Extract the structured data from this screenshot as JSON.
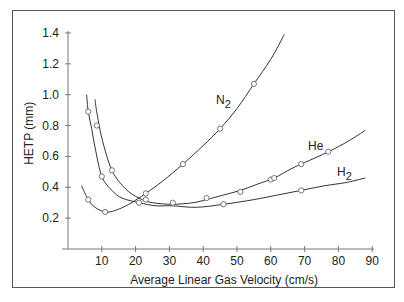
{
  "chart_data": {
    "type": "line",
    "title": "",
    "xlabel": "Average Linear Gas Velocity (cm/s)",
    "ylabel": "HETP (mm)",
    "xlim": [
      0,
      90
    ],
    "ylim": [
      0,
      1.4
    ],
    "xticks": [
      10,
      20,
      30,
      40,
      50,
      60,
      70,
      80,
      90
    ],
    "yticks": [
      0.2,
      0.4,
      0.6,
      0.8,
      1.0,
      1.2,
      1.4
    ],
    "ytick_labels": [
      "0.2",
      "0.4",
      "0.6",
      "0.8",
      "1.0",
      "1.2",
      "1.4"
    ],
    "grid": false,
    "legend": "inline labels",
    "series": [
      {
        "name": "N2",
        "label_main": "N",
        "label_sub": "2",
        "curve": [
          [
            4,
            0.41
          ],
          [
            6,
            0.32
          ],
          [
            8,
            0.27
          ],
          [
            11,
            0.24
          ],
          [
            14,
            0.25
          ],
          [
            18,
            0.29
          ],
          [
            23,
            0.36
          ],
          [
            28,
            0.44
          ],
          [
            34,
            0.55
          ],
          [
            40,
            0.67
          ],
          [
            45,
            0.78
          ],
          [
            50,
            0.91
          ],
          [
            55,
            1.07
          ],
          [
            60,
            1.23
          ],
          [
            64,
            1.39
          ]
        ],
        "markers": [
          [
            6,
            0.32
          ],
          [
            11,
            0.24
          ],
          [
            23,
            0.36
          ],
          [
            34,
            0.55
          ],
          [
            45,
            0.78
          ],
          [
            55,
            1.07
          ]
        ]
      },
      {
        "name": "He",
        "label_main": "He",
        "label_sub": "",
        "curve": [
          [
            8,
            0.97
          ],
          [
            8.5,
            0.89
          ],
          [
            10,
            0.72
          ],
          [
            13,
            0.51
          ],
          [
            17,
            0.39
          ],
          [
            21,
            0.33
          ],
          [
            25,
            0.3
          ],
          [
            31,
            0.29
          ],
          [
            37,
            0.3
          ],
          [
            41,
            0.32
          ],
          [
            46,
            0.35
          ],
          [
            51,
            0.38
          ],
          [
            56,
            0.42
          ],
          [
            61,
            0.46
          ],
          [
            66,
            0.52
          ],
          [
            70,
            0.56
          ],
          [
            77,
            0.63
          ],
          [
            83,
            0.7
          ],
          [
            88,
            0.77
          ]
        ],
        "markers": [
          [
            8.5,
            0.8
          ],
          [
            13,
            0.51
          ],
          [
            23,
            0.32
          ],
          [
            51,
            0.37
          ],
          [
            60,
            0.45
          ],
          [
            61,
            0.46
          ],
          [
            69,
            0.55
          ],
          [
            77,
            0.63
          ]
        ]
      },
      {
        "name": "H2",
        "label_main": "H",
        "label_sub": "2",
        "curve": [
          [
            5.5,
            1.0
          ],
          [
            6,
            0.89
          ],
          [
            7,
            0.78
          ],
          [
            8,
            0.66
          ],
          [
            10,
            0.47
          ],
          [
            13,
            0.38
          ],
          [
            16,
            0.33
          ],
          [
            21,
            0.3
          ],
          [
            26,
            0.28
          ],
          [
            31,
            0.28
          ],
          [
            38,
            0.27
          ],
          [
            46,
            0.29
          ],
          [
            55,
            0.32
          ],
          [
            62,
            0.35
          ],
          [
            69,
            0.38
          ],
          [
            76,
            0.41
          ],
          [
            82,
            0.43
          ],
          [
            88,
            0.46
          ]
        ],
        "markers": [
          [
            6,
            0.89
          ],
          [
            10,
            0.47
          ],
          [
            21,
            0.3
          ],
          [
            31,
            0.3
          ],
          [
            41,
            0.33
          ],
          [
            46,
            0.29
          ],
          [
            69,
            0.38
          ]
        ]
      }
    ]
  },
  "axes": {
    "x_title": "Average Linear Gas Velocity (cm/s)",
    "y_title": "HETP (mm)"
  }
}
